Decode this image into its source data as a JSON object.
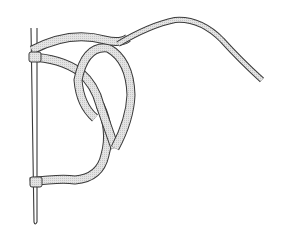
{
  "figure": {
    "description": "Line drawing of a rope tied in a looped knot around a thin vertical rod",
    "canvas": {
      "width": 281,
      "height": 229,
      "background": "#ffffff"
    },
    "colors": {
      "outline": "#3a3a3a",
      "rope_fill": "#d9d9d9",
      "rod_fill": "#ffffff"
    },
    "elements": [
      {
        "name": "rod",
        "kind": "vertical needle/rod",
        "x_top": 33,
        "y_top": 28,
        "x_bottom": 36,
        "y_bottom": 224
      },
      {
        "name": "upper-wrap",
        "kind": "rope wrap around rod",
        "y": 57
      },
      {
        "name": "lower-wrap",
        "kind": "rope wrap around rod",
        "y": 187
      },
      {
        "name": "loop",
        "kind": "rope loop forming the knot",
        "center_x": 108,
        "center_y": 80
      },
      {
        "name": "standing-end",
        "kind": "rope tail curving to the right",
        "end_x": 262,
        "end_y": 80
      }
    ]
  }
}
